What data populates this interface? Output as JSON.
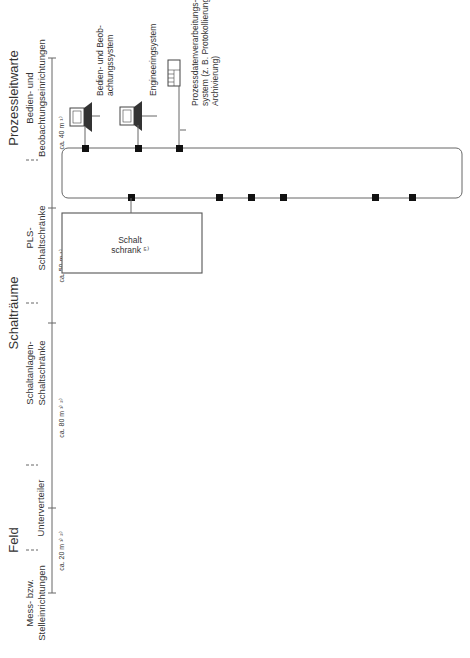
{
  "columns": {
    "feld": {
      "title": "Feld",
      "sub": "Mess- bzw. Stelleinrichtungen",
      "sub1": "Mess- bzw.",
      "sub2": "Stelleinrichtungen",
      "distance": "ca. 20 m ¹⁾ ²⁾"
    },
    "unterverteiler": {
      "title": "Unterverteiler",
      "distance": "ca. 80 m ¹⁾ ²⁾"
    },
    "schaltraeume": {
      "title": "Schalträume",
      "sub1": "Schaltanlagen-",
      "sub2": "Schaltschränke",
      "distance": "ca. 50 m ¹⁾"
    },
    "pls": {
      "sub1": "PLS-",
      "sub2": "Schaltschränke",
      "distance": "ca. 40 m ¹⁾"
    },
    "warte": {
      "title": "Prozessleitwarte",
      "sub1": "Bedien- und",
      "sub2": "Beobachtungseinrichtungen"
    }
  },
  "warte_devices": [
    {
      "l1": "Bedien- und Beob-",
      "l2": "achtungssystem",
      "icon": "workstation-icon"
    },
    {
      "l1": "Engineeringsystem",
      "l2": "",
      "icon": "workstation-icon"
    },
    {
      "l1": "Prozessdatenverarbeitungs-",
      "l2": "system (z. B. Protokollierung,",
      "l3": "Archivierung)",
      "icon": "server-rack-icon"
    }
  ],
  "schaltschrank": {
    "l1": "Schalt",
    "l2": "schrank ⁵⁾"
  },
  "unterverteiler_box": {
    "l1": "Unterver-",
    "l2": "teiler",
    "l2_fn": "teiler ⁴⁾"
  },
  "cables": {
    "c_agl": "Agl Si(St)Si 2x1,5",
    "c_je_1_2": "JE-Y(St)Y 1/2x2x0,8",
    "c_je_1a": "JE-Y(St)Y 1x2x0,8",
    "c_je_1b": "JE-Y(St)Y 1x2x0,8",
    "c_je_4": "JE-Y(St)Y 4x2x0,8",
    "c_je_2a": "JE-Y(St)Y 2x2x0,8",
    "c_nyy_3": "NYY-J 3x1,5",
    "c_je_2b": "JE-Y(St)Y 2x2x0,8",
    "c_je_4_3": "JE-Y(St)Y 4/3x2x0,8",
    "c_je_2c": "JE-Y(St)Y 2x2x0,8",
    "c_je_3": "JE-Y(St)Y 3x2x0,8",
    "c_uv_20": "JE-Y(St)Y 20x2x0,8",
    "c_uv_40": "JE-Y(St)Y 40/20x2x0,8",
    "c_uv_nyy30": "NYY-J 30x1,5",
    "c_uv_40b": "JE-Y(St)Y 40/20x2x0,8",
    "c_uv_40c": "JE-Y(St)Y 40/20x2x0,8",
    "c_sr_koppel": "JE-Y(St)Y 20x2x0,8",
    "c_sr_schuetz": "JE-Y(St)Y 20x2x0,8",
    "c_sr_fu": "JE-Y(St)Y 4x2x0,8",
    "c_sr_verb": "JE-Y(St)Y 4/2x2x0,8"
  },
  "arrow_label": "<...>",
  "field_notes": {
    "v24": "24 VDC",
    "v230": "230 VAC",
    "motorschutz_1": "Motorschutz-",
    "motorschutz_2": "schalter",
    "verbraucher_1": "Verbraucher-",
    "verbraucher_2": "abzweig",
    "strom_1": "Stromversorgung für",
    "strom_2": "Vergleichsstellenthermostat"
  },
  "schaltanlagen": {
    "koppel": {
      "l1": "Koppel-",
      "l2": "relais",
      "inputs": [
        "3d",
        "N",
        "+24 VDC"
      ]
    },
    "schuetz": {
      "l1": "Schalt-",
      "l2": "schütze",
      "inputs": [
        "3d",
        "N",
        "L"
      ]
    },
    "fu": {
      "l1": "Frequenz-",
      "l2": "umrichter",
      "inputs": [
        "3d",
        "N",
        "E1",
        "E2",
        "E3"
      ]
    },
    "verb": {
      "l1": "Verbrau-",
      "l2": "cherab",
      "l3": "zweig",
      "inputs": [
        "3d",
        "N",
        "E1",
        "E2",
        "E3"
      ]
    }
  },
  "motor_symbol": "M",
  "footnotes": [
    {
      "mark": "¹⁾",
      "lines": [
        "Typische Entfernung"
      ]
    },
    {
      "mark": "²⁾",
      "lines": [
        "Bei Verkabelung im explosionsge-",
        "schützten Bereich sind eigensichere",
        "Kabel zu verwenden!"
      ]
    },
    {
      "mark": "³⁾",
      "lines": [
        "Pneumatische Hilfsenergieversorgung",
        "nicht dargestellt"
      ]
    },
    {
      "mark": "⁴⁾",
      "lines": [
        "Enthält gleichzeitig Vergleichsstellen-",
        "thermostat für Thermoelemente."
      ]
    },
    {
      "mark": "⁵⁾",
      "lines": [
        "zur Aufnahme der speicherprogram-",
        "mierbaren Technik vorgesehen"
      ]
    }
  ],
  "legend": [
    {
      "symbol": "<...>",
      "lines": [
        "Jeweils Anzahl erforderlicher Stich-",
        "bzw. Stammkabel eintragen"
      ]
    },
    {
      "symbol": "- - - -",
      "lines": [
        "Meist Lieferumfang Schaltanlagen-",
        "lieferant bzw. Kundenbeistellung"
      ]
    }
  ],
  "footer": "Zeichenerklärung siehe folgende Seite!"
}
